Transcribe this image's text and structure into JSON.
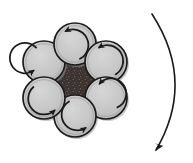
{
  "figure": {
    "type": "mechanical-rotation-diagram",
    "background_color": "#ffffff",
    "canvas": {
      "width": 193,
      "height": 163
    }
  },
  "colors": {
    "circle_fill": "#c6c6c6",
    "circle_fill_light": "#d2d2d2",
    "circle_outline": "#1c1c1c",
    "circle_inner_ring": "#8e8e8e",
    "center_fill": "#3a3330",
    "center_speckle": "#6a5f59",
    "arrow_stroke": "#1a1a1a",
    "shadow": "#9b9b9b"
  },
  "cluster": {
    "name": "six-circle-hexagonal-cluster",
    "center": {
      "x": 75,
      "y": 80
    },
    "orbit_radius": 36,
    "circle_radius": 21,
    "count": 6,
    "circles": [
      {
        "id": "circle-top",
        "label": "top",
        "cx": 75,
        "cy": 44,
        "r": 21,
        "spin": "counterclockwise"
      },
      {
        "id": "circle-upper-right",
        "label": "upper-right",
        "cx": 106,
        "cy": 62,
        "r": 21,
        "spin": "counterclockwise"
      },
      {
        "id": "circle-lower-right",
        "label": "lower-right",
        "cx": 106,
        "cy": 98,
        "r": 21,
        "spin": "counterclockwise"
      },
      {
        "id": "circle-bottom",
        "label": "bottom",
        "cx": 75,
        "cy": 116,
        "r": 21,
        "spin": "counterclockwise"
      },
      {
        "id": "circle-lower-left",
        "label": "lower-left",
        "cx": 44,
        "cy": 98,
        "r": 21,
        "spin": "counterclockwise"
      },
      {
        "id": "circle-upper-left",
        "label": "upper-left",
        "cx": 44,
        "cy": 62,
        "r": 21,
        "spin": "counterclockwise"
      }
    ]
  },
  "center_region": {
    "name": "dark-hexagonal-core",
    "shape": "concave-hexagon",
    "fill": "#3a3330",
    "texture": "speckled"
  },
  "bulk_arrow": {
    "name": "large-curved-direction-arrow",
    "direction": "clockwise-downward",
    "start": {
      "x": 152,
      "y": 14
    },
    "control": {
      "x": 196,
      "y": 82
    },
    "end": {
      "x": 156,
      "y": 150
    },
    "arrowhead_at": "end",
    "arrowhead_points": "down-left",
    "stroke_width": 1.6
  },
  "spin_arrows": {
    "name": "individual-rotation-arrows",
    "style": "open-ring-with-arrowhead",
    "direction_all": "counterclockwise",
    "ring_radius_ratio": 0.72,
    "stroke_width": 1.7
  },
  "labels": {
    "alt_text": "Six shaded circles arranged in a ring around a dark textured center; each circle carries a counterclockwise rotation arrow, and a large curved arrow at the right indicates overall downward clockwise motion."
  }
}
